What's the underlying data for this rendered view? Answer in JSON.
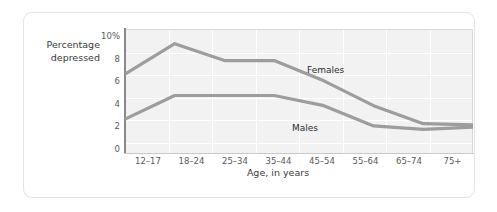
{
  "chart_data": {
    "type": "line",
    "title": "",
    "xlabel": "Age, in years",
    "ylabel": "Percentage\ndepressed",
    "categories": [
      "12–17",
      "18–24",
      "25–34",
      "35–44",
      "45–54",
      "55–64",
      "65–74",
      "75+"
    ],
    "ylim": [
      0,
      11
    ],
    "yticks": [
      0,
      2,
      4,
      6,
      8,
      10
    ],
    "ytick_labels": [
      "0",
      "2",
      "4",
      "6",
      "8",
      "10%"
    ],
    "grid": true,
    "legend_position": "inline-annotations",
    "series": [
      {
        "name": "Females",
        "values": [
          7.0,
          9.7,
          8.2,
          8.2,
          6.4,
          4.2,
          2.6,
          2.5
        ],
        "color": "#9d9d9d"
      },
      {
        "name": "Males",
        "values": [
          3.0,
          5.1,
          5.1,
          5.1,
          4.2,
          2.4,
          2.1,
          2.3
        ],
        "color": "#9d9d9d"
      }
    ],
    "annotations": [
      {
        "text": "Females",
        "series": "Females"
      },
      {
        "text": "Males",
        "series": "Males"
      }
    ]
  }
}
